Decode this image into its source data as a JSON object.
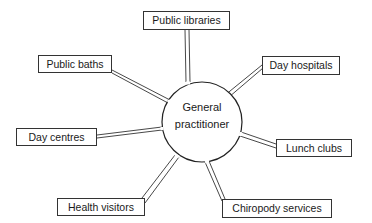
{
  "diagram": {
    "center": {
      "label_line1": "General",
      "label_line2": "practitioner",
      "cx": 202,
      "cy": 122,
      "r": 40
    },
    "nodes": [
      {
        "id": "public-libraries",
        "label": "Public libraries",
        "x": 143,
        "y": 11,
        "w": 87,
        "h": 19
      },
      {
        "id": "public-baths",
        "label": "Public baths",
        "x": 38,
        "y": 55,
        "w": 74,
        "h": 18
      },
      {
        "id": "day-hospitals",
        "label": "Day hospitals",
        "x": 262,
        "y": 56,
        "w": 78,
        "h": 19
      },
      {
        "id": "day-centres",
        "label": "Day centres",
        "x": 16,
        "y": 128,
        "w": 81,
        "h": 18
      },
      {
        "id": "lunch-clubs",
        "label": "Lunch clubs",
        "x": 276,
        "y": 139,
        "w": 76,
        "h": 18
      },
      {
        "id": "health-visitors",
        "label": "Health visitors",
        "x": 57,
        "y": 198,
        "w": 88,
        "h": 18
      },
      {
        "id": "chiropody-services",
        "label": "Chiropody services",
        "x": 222,
        "y": 199,
        "w": 110,
        "h": 19
      }
    ],
    "line_color": "#333333"
  }
}
